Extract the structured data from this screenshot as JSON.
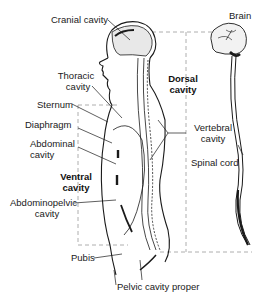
{
  "diagram": {
    "labels": {
      "cranial_cavity": "Cranial cavity",
      "thoracic_cavity_1": "Thoracic",
      "thoracic_cavity_2": "cavity",
      "sternum": "Sternum",
      "diaphragm": "Diaphragm",
      "abdominal_cavity_1": "Abdominal",
      "abdominal_cavity_2": "cavity",
      "ventral_cavity_1": "Ventral",
      "ventral_cavity_2": "cavity",
      "abdominopelvic_cavity_1": "Abdominopelvic",
      "abdominopelvic_cavity_2": "cavity",
      "pubis": "Pubis",
      "pelvic_cavity_proper": "Pelvic cavity proper",
      "brain": "Brain",
      "dorsal_cavity_1": "Dorsal",
      "dorsal_cavity_2": "cavity",
      "vertebral_cavity_1": "Vertebral",
      "vertebral_cavity_2": "cavity",
      "spinal_cord": "Spinal cord"
    },
    "colors": {
      "ink": "#1a1a1a",
      "dashed": "#999999",
      "background": "#ffffff"
    }
  }
}
